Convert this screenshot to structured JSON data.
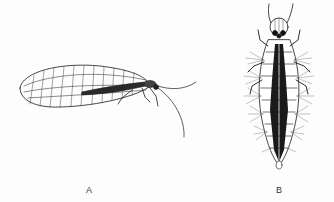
{
  "figure": {
    "panels": [
      {
        "id": "A",
        "label": "A",
        "subject": "adult lacewing, lateral view"
      },
      {
        "id": "B",
        "label": "B",
        "subject": "lacewing larva, dorsal view"
      }
    ],
    "colors": {
      "background": "#fdfdfd",
      "ink": "#1a1a1a",
      "label": "#333333"
    }
  }
}
